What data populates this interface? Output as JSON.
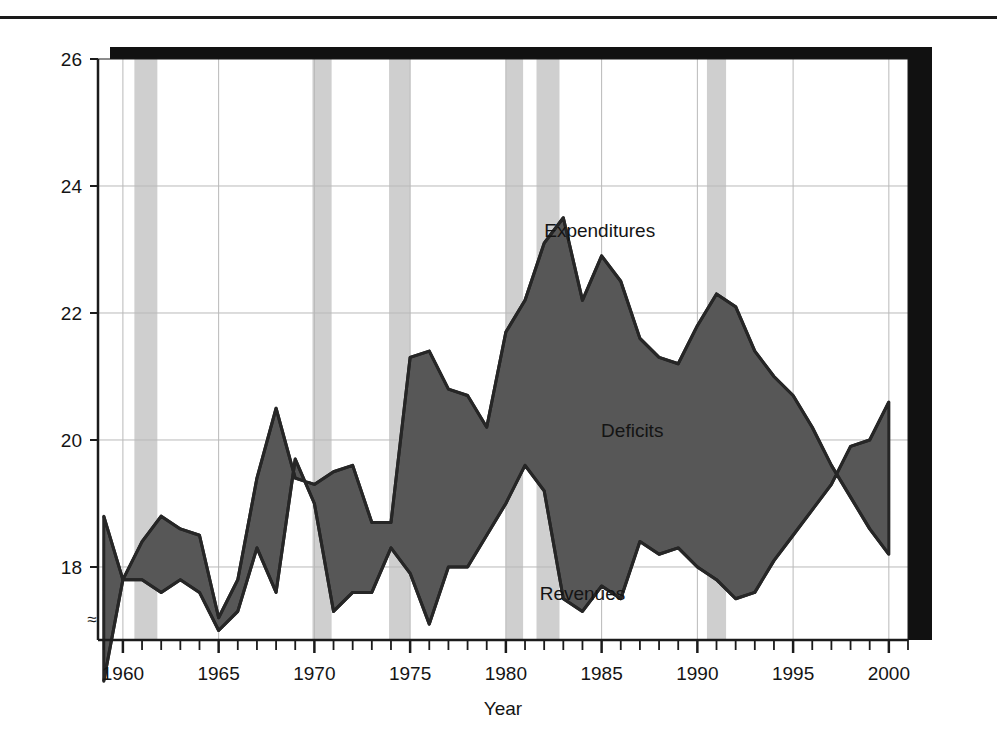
{
  "figure": {
    "has_top_rule": true,
    "shadow_color": "#111111",
    "plot_bg": "#ffffff",
    "frame_color": "#1b1b1b",
    "gridline_color": "#b9b9b9",
    "band_color": "#cfcfcf",
    "fill_color": "#575757",
    "line_color": "#262626"
  },
  "axes": {
    "x": {
      "label": "Year",
      "min": 1958.7,
      "max": 2001.0,
      "tick_step": 1,
      "label_step": 5,
      "tick_labels": [
        "1960",
        "1965",
        "1970",
        "1975",
        "1980",
        "1985",
        "1990",
        "1995",
        "2000"
      ],
      "tick_label_values": [
        1960,
        1965,
        1970,
        1975,
        1980,
        1985,
        1990,
        1995,
        2000
      ]
    },
    "y": {
      "label": "",
      "min": 16.85,
      "max": 26.0,
      "tick_labels": [
        "18",
        "20",
        "22",
        "24",
        "26"
      ],
      "tick_label_values": [
        18,
        20,
        22,
        24,
        26
      ],
      "axis_break_symbol": "≈",
      "axis_break_value": 17.2
    }
  },
  "annotations": [
    {
      "name": "expenditures-label",
      "text": "Expenditures",
      "x": 1984.9,
      "y": 23.2
    },
    {
      "name": "deficits-label",
      "text": "Deficits",
      "x": 1986.6,
      "y": 20.05
    },
    {
      "name": "revenues-label",
      "text": "Revenues",
      "x": 1984.0,
      "y": 17.48
    }
  ],
  "chart_data": {
    "type": "area",
    "title": "",
    "xlabel": "Year",
    "ylabel": "",
    "xlim": [
      1958.7,
      2001.0
    ],
    "ylim": [
      16.85,
      26.0
    ],
    "grid": true,
    "legend": "inline-annotations",
    "units": "percent of GDP",
    "x": [
      1959,
      1960,
      1961,
      1962,
      1963,
      1964,
      1965,
      1966,
      1967,
      1968,
      1969,
      1970,
      1971,
      1972,
      1973,
      1974,
      1975,
      1976,
      1977,
      1978,
      1979,
      1980,
      1981,
      1982,
      1983,
      1984,
      1985,
      1986,
      1987,
      1988,
      1989,
      1990,
      1991,
      1992,
      1993,
      1994,
      1995,
      1996,
      1997,
      1998,
      1999,
      2000
    ],
    "series": [
      {
        "name": "Expenditures",
        "values": [
          18.8,
          17.8,
          18.4,
          18.8,
          18.6,
          18.5,
          17.2,
          17.8,
          19.4,
          20.5,
          19.4,
          19.3,
          19.5,
          19.6,
          18.7,
          18.7,
          21.3,
          21.4,
          20.8,
          20.7,
          20.2,
          21.7,
          22.2,
          23.1,
          23.5,
          22.2,
          22.9,
          22.5,
          21.6,
          21.3,
          21.2,
          21.8,
          22.3,
          22.1,
          21.4,
          21.0,
          20.7,
          20.2,
          19.6,
          19.1,
          18.6,
          18.2
        ]
      },
      {
        "name": "Revenues",
        "values": [
          16.2,
          17.8,
          17.8,
          17.6,
          17.8,
          17.6,
          17.0,
          17.3,
          18.3,
          17.6,
          19.7,
          19.0,
          17.3,
          17.6,
          17.6,
          18.3,
          17.9,
          17.1,
          18.0,
          18.0,
          18.5,
          19.0,
          19.6,
          19.2,
          17.5,
          17.3,
          17.7,
          17.5,
          18.4,
          18.2,
          18.3,
          18.0,
          17.8,
          17.5,
          17.6,
          18.1,
          18.5,
          18.9,
          19.3,
          19.9,
          20.0,
          20.6
        ]
      }
    ]
  },
  "recession_bands": [
    {
      "start": 1960.6,
      "end": 1961.8
    },
    {
      "start": 1969.9,
      "end": 1970.9
    },
    {
      "start": 1973.9,
      "end": 1975.0
    },
    {
      "start": 1980.0,
      "end": 1980.9
    },
    {
      "start": 1981.6,
      "end": 1982.8
    },
    {
      "start": 1990.5,
      "end": 1991.5
    }
  ]
}
